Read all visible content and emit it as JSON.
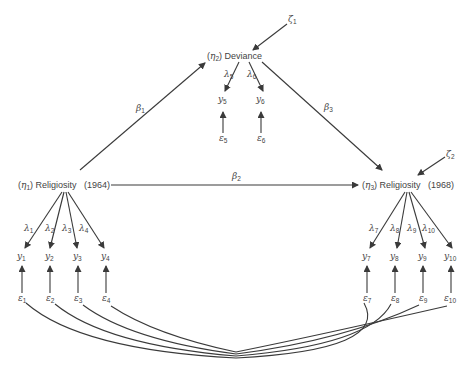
{
  "diagram": {
    "type": "structural-equation-model",
    "latent": {
      "eta1": {
        "symbol": "η",
        "sub": "1",
        "name": "Religiosity",
        "year": "(1964)"
      },
      "eta2": {
        "symbol": "η",
        "sub": "2",
        "name": "Deviance"
      },
      "eta3": {
        "symbol": "η",
        "sub": "3",
        "name": "Religiosity",
        "year": "(1968)"
      }
    },
    "paths": {
      "beta1": {
        "symbol": "β",
        "sub": "1"
      },
      "beta2": {
        "symbol": "β",
        "sub": "2"
      },
      "beta3": {
        "symbol": "β",
        "sub": "3"
      }
    },
    "disturbances": {
      "zeta1": {
        "symbol": "ζ",
        "sub": "1"
      },
      "zeta2": {
        "symbol": "ζ",
        "sub": "2"
      }
    },
    "loadings": [
      {
        "symbol": "λ",
        "sub": "1"
      },
      {
        "symbol": "λ",
        "sub": "2"
      },
      {
        "symbol": "λ",
        "sub": "3"
      },
      {
        "symbol": "λ",
        "sub": "4"
      },
      {
        "symbol": "λ",
        "sub": "5"
      },
      {
        "symbol": "λ",
        "sub": "6"
      },
      {
        "symbol": "λ",
        "sub": "7"
      },
      {
        "symbol": "λ",
        "sub": "8"
      },
      {
        "symbol": "λ",
        "sub": "9"
      },
      {
        "symbol": "λ",
        "sub": "10"
      }
    ],
    "indicators": [
      {
        "symbol": "y",
        "sub": "1"
      },
      {
        "symbol": "y",
        "sub": "2"
      },
      {
        "symbol": "y",
        "sub": "3"
      },
      {
        "symbol": "y",
        "sub": "4"
      },
      {
        "symbol": "y",
        "sub": "5"
      },
      {
        "symbol": "y",
        "sub": "6"
      },
      {
        "symbol": "y",
        "sub": "7"
      },
      {
        "symbol": "y",
        "sub": "8"
      },
      {
        "symbol": "y",
        "sub": "9"
      },
      {
        "symbol": "y",
        "sub": "10"
      }
    ],
    "errors": [
      {
        "symbol": "ε",
        "sub": "1"
      },
      {
        "symbol": "ε",
        "sub": "2"
      },
      {
        "symbol": "ε",
        "sub": "3"
      },
      {
        "symbol": "ε",
        "sub": "4"
      },
      {
        "symbol": "ε",
        "sub": "5"
      },
      {
        "symbol": "ε",
        "sub": "6"
      },
      {
        "symbol": "ε",
        "sub": "7"
      },
      {
        "symbol": "ε",
        "sub": "8"
      },
      {
        "symbol": "ε",
        "sub": "9"
      },
      {
        "symbol": "ε",
        "sub": "10"
      }
    ],
    "colors": {
      "line": "#3a3a3a",
      "text": "#444444",
      "background": "#ffffff"
    }
  }
}
